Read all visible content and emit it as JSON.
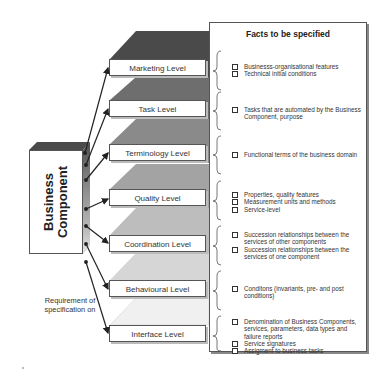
{
  "diagram": {
    "component": {
      "line1": "Business",
      "line2": "Component"
    },
    "requirement_label": {
      "line1": "Requirement of",
      "line2": "specification on"
    },
    "facts_title": "Facts to be specified",
    "levels": [
      {
        "name": "Marketing Level",
        "color": "#4a4a4a",
        "facts": [
          "Businesss-organisational features",
          "Technical initial conditions"
        ]
      },
      {
        "name": "Task Level",
        "color": "#6e6e6e",
        "facts": [
          "Tasks that are automated by the Business Component, purpose"
        ]
      },
      {
        "name": "Terminology Level",
        "color": "#8a8a8a",
        "facts": [
          "Functional terms of the business domain"
        ]
      },
      {
        "name": "Quality Level",
        "color": "#a3a3a3",
        "facts": [
          "Properties, quality features",
          "Measurement units and methods",
          "Service-level"
        ]
      },
      {
        "name": "Coordination Level",
        "color": "#bdbdbd",
        "facts": [
          "Succession relationships between the services of other components",
          "Succession relationships between the services of one component"
        ]
      },
      {
        "name": "Behavioural Level",
        "color": "#d6d6d6",
        "facts": [
          "Conditons (invariants, pre- and post conditions)"
        ]
      },
      {
        "name": "Interface Level",
        "color": "#f0f0f0",
        "facts": [
          "Denomination of Business Components, services, parameters, data types and failure reports",
          "Service signatures",
          "Assigment to business tasks"
        ]
      }
    ]
  }
}
